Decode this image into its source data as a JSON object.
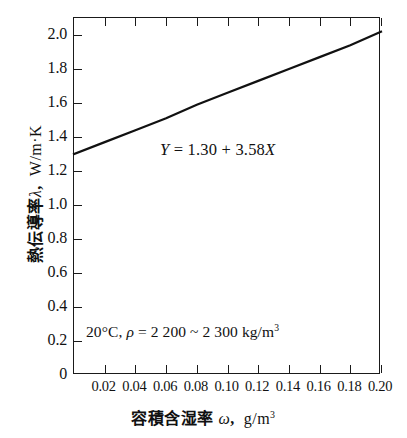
{
  "chart_data": {
    "type": "line",
    "title": "",
    "xlabel": "容積含湿率 ω,  g/m³",
    "ylabel": "熱伝導率 λ,  W/m·K",
    "xlim": [
      0,
      0.2
    ],
    "ylim": [
      0,
      2.1
    ],
    "grid": false,
    "legend": "none",
    "xticks": [
      "0.02",
      "0.04",
      "0.06",
      "0.08",
      "0.10",
      "0.12",
      "0.14",
      "0.16",
      "0.18",
      "0.20"
    ],
    "xtick_values": [
      0.02,
      0.04,
      0.06,
      0.08,
      0.1,
      0.12,
      0.14,
      0.16,
      0.18,
      0.2
    ],
    "yticks": [
      "0",
      "0.2",
      "0.4",
      "0.6",
      "0.8",
      "1.0",
      "1.2",
      "1.4",
      "1.6",
      "1.8",
      "2.0"
    ],
    "ytick_values": [
      0,
      0.2,
      0.4,
      0.6,
      0.8,
      1.0,
      1.2,
      1.4,
      1.6,
      1.8,
      2.0
    ],
    "series": [
      {
        "name": "Y = 1.30 + 3.58X",
        "x": [
          0,
          0.02,
          0.04,
          0.06,
          0.08,
          0.1,
          0.12,
          0.14,
          0.16,
          0.18,
          0.2
        ],
        "values": [
          1.3,
          1.37,
          1.44,
          1.51,
          1.59,
          1.66,
          1.73,
          1.8,
          1.87,
          1.94,
          2.02
        ],
        "color": "#111111",
        "linewidth": 2
      }
    ],
    "annotations": {
      "equation": {
        "text": "Y = 1.30 + 3.58X",
        "slope": 3.58,
        "intercept": 1.3
      },
      "condition": {
        "text": "20°C,  ρ = 2 200 ~ 2 300 kg/m³",
        "temperature": "20°C",
        "density_range": "2 200 ~ 2 300 kg/m³"
      }
    }
  },
  "axes": {
    "y_title_name": "熱伝導率",
    "y_title_symbol": "λ",
    "y_title_unit": "W/m·K",
    "x_title_name": "容積含湿率",
    "x_title_symbol": "ω",
    "x_title_unit_base": "g/m",
    "x_title_unit_exp": "3",
    "y_zero_label": "0"
  },
  "annotation_parts": {
    "eq_lhs": "Y",
    "eq_eq": " = ",
    "eq_intercept": "1.30",
    "eq_plus": " + ",
    "eq_slope": "3.58",
    "eq_var": "X",
    "cond_temp": "20°C,  ",
    "cond_rho": "ρ",
    "cond_eq": " = 2 200 ~ 2 300 kg/m",
    "cond_exp": "3"
  },
  "colors": {
    "axis": "#1a1a1a",
    "line": "#111111",
    "background": "#ffffff",
    "text": "#111111"
  }
}
